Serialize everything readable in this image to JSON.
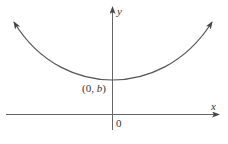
{
  "diagram": {
    "type": "function-graph",
    "axes": {
      "x_label": "x",
      "y_label": "y",
      "origin_label": "0"
    },
    "point_label": {
      "open": "(0, ",
      "var": "b",
      "close": ")"
    },
    "colors": {
      "curve": "#555555",
      "axis": "#555555",
      "text": "#333333"
    }
  }
}
